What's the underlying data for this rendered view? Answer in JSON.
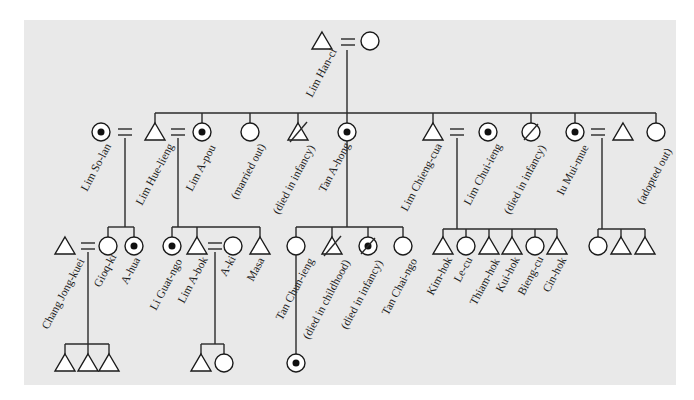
{
  "diagram": {
    "type": "kinship-chart",
    "colors": {
      "background": "#e9e9e9",
      "line": "#2a2a2a",
      "symbol_fill": "#ffffff"
    },
    "legend_symbols": {
      "triangle": "male",
      "circle": "female",
      "dotted-circle": "female (ego-marked)",
      "slashed": "deceased",
      "equals": "marriage"
    },
    "generation1": {
      "founder": {
        "label": "Lim Han-ci",
        "symbol": "triangle"
      },
      "spouse": {
        "label": "",
        "symbol": "circle"
      }
    },
    "generation2": [
      {
        "label": "Lim So-lan",
        "symbol": "dotted-circle"
      },
      {
        "label": "Lim Hue-lieng",
        "symbol": "triangle"
      },
      {
        "label": "Lim A-pou",
        "symbol": "dotted-circle"
      },
      {
        "label": "(married out)",
        "symbol": "circle"
      },
      {
        "label": "(died in infancy)",
        "symbol": "slashed-triangle"
      },
      {
        "label": "Tan A-hong",
        "symbol": "dotted-circle"
      },
      {
        "label": "Lim Chieng-cua",
        "symbol": "triangle"
      },
      {
        "label": "Lim Chui-ieng",
        "symbol": "dotted-circle"
      },
      {
        "label": "(died in infancy)",
        "symbol": "slashed-circle"
      },
      {
        "label": "Iu Mui-mue",
        "symbol": "dotted-circle"
      },
      {
        "label": "",
        "symbol": "triangle"
      },
      {
        "label": "(adopted out)",
        "symbol": "circle"
      }
    ],
    "generation3": [
      {
        "label": "Chang Jong-kuei",
        "symbol": "triangle"
      },
      {
        "label": "Gioq-ki",
        "symbol": "circle"
      },
      {
        "label": "A-hua",
        "symbol": "dotted-circle"
      },
      {
        "label": "Li Guat-ngo",
        "symbol": "dotted-circle"
      },
      {
        "label": "Lim A-bok",
        "symbol": "triangle"
      },
      {
        "label": "A-ki",
        "symbol": "circle"
      },
      {
        "label": "Masa",
        "symbol": "triangle"
      },
      {
        "label": "Tan Chun-ieng",
        "symbol": "circle"
      },
      {
        "label": "(died in childhood)",
        "symbol": "slashed-triangle"
      },
      {
        "label": "(died in infancy)",
        "symbol": "slashed-dotted-circle"
      },
      {
        "label": "Tan Chai-ngo",
        "symbol": "circle"
      },
      {
        "label": "Kim-hok",
        "symbol": "triangle"
      },
      {
        "label": "Le-cu",
        "symbol": "circle"
      },
      {
        "label": "Thiam-hok",
        "symbol": "triangle"
      },
      {
        "label": "Kui-hok",
        "symbol": "triangle"
      },
      {
        "label": "Bieng-cu",
        "symbol": "circle"
      },
      {
        "label": "Cin-hok",
        "symbol": "triangle"
      },
      {
        "label": "",
        "symbol": "circle"
      },
      {
        "label": "",
        "symbol": "triangle"
      },
      {
        "label": "",
        "symbol": "triangle"
      }
    ],
    "generation4": [
      {
        "group": "Chang Jong-kuei = Gioq-ki children",
        "symbols": [
          "triangle",
          "triangle",
          "triangle"
        ]
      },
      {
        "group": "Lim A-bok = A-ki children",
        "symbols": [
          "triangle",
          "circle"
        ]
      },
      {
        "group": "Tan Chun-ieng child",
        "symbols": [
          "dotted-circle"
        ]
      }
    ]
  }
}
